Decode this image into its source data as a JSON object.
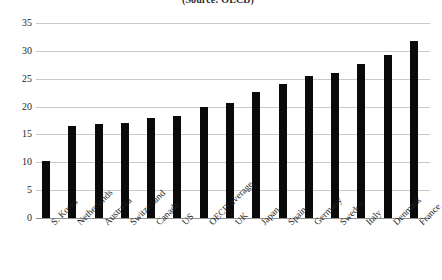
{
  "chart_data": {
    "type": "bar",
    "title": "(Source: OECD)",
    "subtitle": "",
    "xlabel": "",
    "ylabel": "",
    "ylim": [
      0,
      35
    ],
    "ytick_step": 5,
    "yticks": [
      35,
      30,
      25,
      20,
      15,
      10,
      5,
      0
    ],
    "grid": true,
    "legend": "none",
    "bar_color": "#0a0a0a",
    "gridline_color": "#c9c9c9",
    "categories": [
      "S. Korea",
      "Netherlands",
      "Australia",
      "Switzerland",
      "Canada",
      "US",
      "OECD average",
      "UK",
      "Japan",
      "Spain",
      "Germany",
      "Sweden",
      "Italy",
      "Denmark",
      "France"
    ],
    "values": [
      10.2,
      16.5,
      16.8,
      17.1,
      18.0,
      18.4,
      20.0,
      20.6,
      22.6,
      24.0,
      25.5,
      26.1,
      27.7,
      29.3,
      31.8
    ]
  }
}
